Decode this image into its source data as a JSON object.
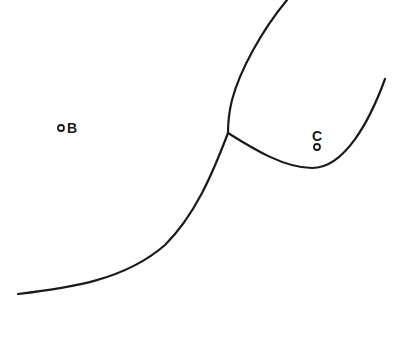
{
  "diagram": {
    "type": "phase-boundary-sketch",
    "colors": {
      "background": "#ffffff",
      "ink": "#1a1a1a"
    },
    "curves": [
      {
        "name": "upper-boundary",
        "from": [
          287,
          0
        ],
        "to": [
          228,
          133
        ]
      },
      {
        "name": "lower-boundary",
        "from": [
          228,
          133
        ],
        "to": [
          18,
          294
        ]
      },
      {
        "name": "right-boundary",
        "from": [
          228,
          133
        ],
        "via": [
          310,
          168
        ],
        "to": [
          385,
          79
        ]
      }
    ],
    "junction": [
      228,
      133
    ],
    "points": [
      {
        "id": "B",
        "label": "B",
        "marker": [
          61,
          128
        ],
        "label_pos": [
          68,
          133
        ]
      },
      {
        "id": "C",
        "label": "C",
        "marker": [
          317,
          147
        ],
        "label_pos": [
          312,
          139
        ]
      }
    ]
  }
}
